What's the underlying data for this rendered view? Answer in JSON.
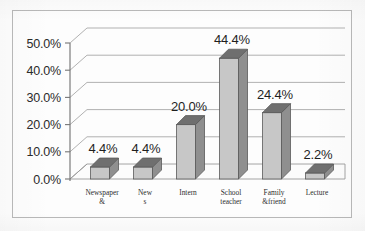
{
  "chart_data": {
    "type": "bar",
    "title": "",
    "subtitle": "",
    "xlabel": "",
    "ylabel": "",
    "categories": [
      "Newspaper &",
      "New s",
      "Intern",
      "School teacher",
      "Family &friend",
      "Lecture"
    ],
    "category_lines": [
      [
        "Newspaper",
        "&"
      ],
      [
        "New",
        "s"
      ],
      [
        "Intern",
        ""
      ],
      [
        "School",
        "teacher"
      ],
      [
        "Family",
        "&friend"
      ],
      [
        "Lecture",
        ""
      ]
    ],
    "values": [
      4.4,
      4.4,
      20.0,
      44.4,
      24.4,
      2.2
    ],
    "data_labels": [
      "4.4%",
      "4.4%",
      "20.0%",
      "44.4%",
      "24.4%",
      "2.2%"
    ],
    "ylim": [
      0,
      50
    ],
    "ytick_values": [
      0,
      10,
      20,
      30,
      40,
      50
    ],
    "ytick_labels": [
      "0.0%",
      "10.0%",
      "20.0%",
      "30.0%",
      "40.0%",
      "50.0%"
    ],
    "grid": true,
    "legend": false,
    "legend_position": "none",
    "style": "3d-column",
    "units": "percent"
  },
  "colors": {
    "bar_front": "#c7c7c7",
    "bar_side": "#8f8f8f",
    "bar_top": "#6f6f6f",
    "bar_outline": "#5a5a5a",
    "gridline": "#a8a8a8",
    "axis": "#767676",
    "floor": "#fbfbfb",
    "border": "#b9b9b9",
    "text": "#1f1f1f",
    "background": "#fdfdfd"
  }
}
